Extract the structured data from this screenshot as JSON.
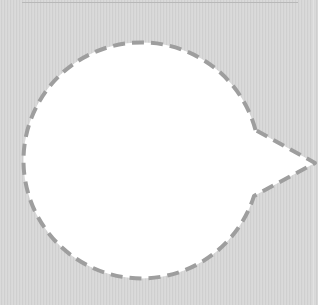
{
  "scene": {
    "description": "Empty speech bubble with dashed outline on gray textured background",
    "background_color": "#d6d6d6",
    "bubble": {
      "fill": "#ffffff",
      "stroke": "#9e9e9e",
      "stroke_width": 4,
      "dash": "12 7",
      "circle": {
        "cx": 140,
        "cy": 167,
        "r": 118
      },
      "pointer": {
        "direction": "right",
        "tip_x": 315,
        "tip_y": 163
      },
      "text": ""
    },
    "top_rule_color": "#b8b8b8"
  }
}
